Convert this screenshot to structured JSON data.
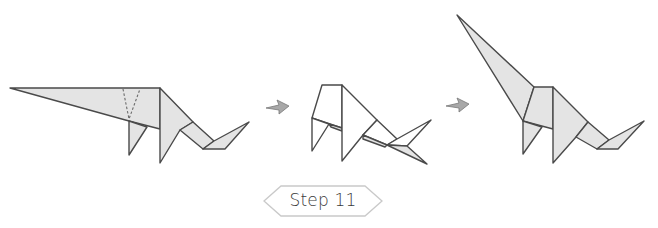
{
  "diagram": {
    "type": "origami-instruction",
    "step": {
      "label": "Step 11",
      "number": 11
    },
    "figures": [
      {
        "id": "before",
        "description": "dinosaur with long neck pointing left, valley-fold dashed lines near body"
      },
      {
        "id": "intermediate",
        "description": "neck being folded up (white inner paper visible)"
      },
      {
        "id": "after",
        "description": "dinosaur with neck raised diagonally up-left"
      }
    ],
    "arrows": [
      {
        "id": "arrow-1",
        "direction": "right"
      },
      {
        "id": "arrow-2",
        "direction": "right"
      }
    ],
    "colors": {
      "paper": "#e4e4e4",
      "paper_inside": "#ffffff",
      "outline": "#4a4a4a",
      "arrow_fill": "#a8a8a8",
      "label_border": "#c9c9c9",
      "label_text": "#3a3a3a"
    }
  }
}
